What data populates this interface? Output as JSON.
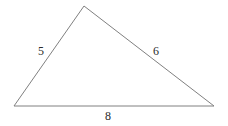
{
  "figure": {
    "kind": "triangle-diagram",
    "background_color": "#ffffff",
    "stroke_color": "#808080",
    "stroke_width": 1,
    "label_color": "#2b2b2b",
    "width": 228,
    "height": 126
  },
  "vertices": {
    "left": {
      "name": "left-vertex",
      "x": 14,
      "y": 106
    },
    "apex": {
      "name": "apex-vertex",
      "x": 84,
      "y": 6
    },
    "right": {
      "name": "right-vertex",
      "x": 214,
      "y": 106
    }
  },
  "sides": [
    {
      "id": "side-a",
      "label": "5",
      "from": "left",
      "to": "apex",
      "label_x": 41,
      "label_y": 51
    },
    {
      "id": "side-b",
      "label": "6",
      "from": "apex",
      "to": "right",
      "label_x": 156,
      "label_y": 51
    },
    {
      "id": "side-c",
      "label": "8",
      "from": "left",
      "to": "right",
      "label_x": 108,
      "label_y": 116
    }
  ],
  "chart_data": {
    "type": "diagram",
    "title": "",
    "shape": "triangle",
    "side_lengths": [
      5,
      6,
      8
    ],
    "side_labels": [
      "5",
      "6",
      "8"
    ],
    "points": [
      [
        14,
        106
      ],
      [
        84,
        6
      ],
      [
        214,
        106
      ]
    ],
    "polygon_points": "14,106 84,6 214,106",
    "xlabel": "",
    "ylabel": "",
    "grid": false,
    "legend": false
  }
}
